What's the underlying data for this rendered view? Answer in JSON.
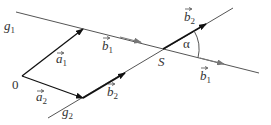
{
  "diagram": {
    "title": "",
    "lines": [
      {
        "name": "g1",
        "label": "g",
        "sub": "1",
        "from": [
          16,
          12
        ],
        "to": [
          259,
          73
        ],
        "color": "#555555"
      },
      {
        "name": "g2",
        "label": "g",
        "sub": "2",
        "from": [
          48,
          118
        ],
        "to": [
          233,
          8
        ],
        "color": "#555555"
      }
    ],
    "points": {
      "origin": {
        "label": "0",
        "at": [
          22,
          76
        ]
      },
      "intersection": {
        "label": "S",
        "at": [
          163,
          49
        ]
      }
    },
    "vectors": [
      {
        "name": "a1",
        "label": "a",
        "sub": "1",
        "from": [
          22,
          76
        ],
        "to": [
          83,
          29
        ],
        "color": "#111111"
      },
      {
        "name": "a2",
        "label": "a",
        "sub": "2",
        "from": [
          22,
          76
        ],
        "to": [
          83,
          98
        ],
        "color": "#111111"
      },
      {
        "name": "b1-upper",
        "label": "b",
        "sub": "1",
        "on": "g1",
        "tip": [
          141,
          42
        ],
        "color": "#777777"
      },
      {
        "name": "b1-lower",
        "label": "b",
        "sub": "1",
        "on": "g1",
        "tip": [
          224,
          64
        ],
        "color": "#777777"
      },
      {
        "name": "b2-lower",
        "label": "b",
        "sub": "2",
        "from": [
          83,
          98
        ],
        "to": [
          125,
          73
        ],
        "color": "#111111"
      },
      {
        "name": "b2-upper",
        "label": "b",
        "sub": "2",
        "from": [
          163,
          49
        ],
        "to": [
          206,
          24
        ],
        "color": "#111111"
      }
    ],
    "angle": {
      "label": "α",
      "vertex": [
        163,
        49
      ],
      "radius": 36
    }
  },
  "labels": {
    "g1": "g",
    "g1_sub": "1",
    "g2": "g",
    "g2_sub": "2",
    "a1": "a",
    "a1_sub": "1",
    "a2": "a",
    "a2_sub": "2",
    "b1_upper": "b",
    "b1_upper_sub": "1",
    "b1_lower": "b",
    "b1_lower_sub": "1",
    "b2_lower": "b",
    "b2_lower_sub": "2",
    "b2_upper": "b",
    "b2_upper_sub": "2",
    "origin": "0",
    "S": "S",
    "alpha": "α"
  }
}
